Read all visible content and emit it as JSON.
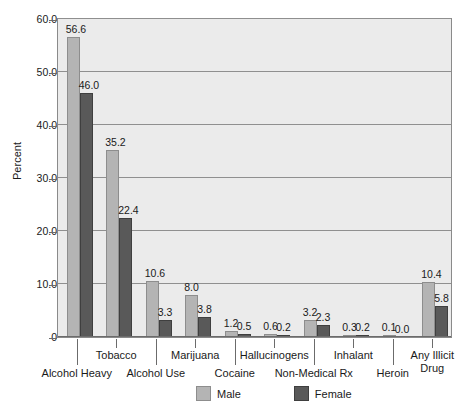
{
  "chart_data": {
    "type": "bar",
    "title": "",
    "xlabel": "",
    "ylabel": "Percent",
    "ylim": [
      0,
      60
    ],
    "grid": true,
    "legend_position": "bottom",
    "categories": [
      "Alcohol Heavy",
      "Tobacco",
      "Alcohol Use",
      "Cocaine",
      "Marijuana",
      "Hallucinogens",
      "Non-Medical Rx",
      "Inhalant",
      "Heroin",
      "Any Illicit Drug"
    ],
    "group_labels": [
      "Alcohol Heavy",
      "Tobacco",
      "Marijuana",
      "Hallucinogens",
      "Inhalant",
      "Any Illicit Drug"
    ],
    "plot_categories": [
      "Alcohol Heavy",
      "Tobacco",
      "Marijuana",
      "Cocaine",
      "Hallucinogens",
      "Non-Medical Rx",
      "Inhalant",
      "Heroin",
      "Any Illicit Drug"
    ],
    "series": [
      {
        "name": "Male",
        "color": "#b4b4b4",
        "values": [
          56.6,
          35.2,
          10.6,
          8.0,
          1.2,
          0.6,
          3.2,
          0.3,
          0.1,
          10.4
        ]
      },
      {
        "name": "Female",
        "color": "#595959",
        "values": [
          46.0,
          22.4,
          3.3,
          3.8,
          0.5,
          0.2,
          2.3,
          0.2,
          0.0,
          5.8
        ]
      }
    ],
    "groups": [
      {
        "label": "Alcohol Heavy",
        "male": 56.6,
        "female": 46.0
      },
      {
        "label": "Tobacco",
        "male": 35.2,
        "female": 22.4
      },
      {
        "label": "Alcohol Use",
        "male": 10.6,
        "female": 3.3
      },
      {
        "label": "Marijuana",
        "male": 8.0,
        "female": 3.8
      },
      {
        "label": "Cocaine",
        "male": 1.2,
        "female": 0.5
      },
      {
        "label": "Hallucinogens",
        "male": 0.6,
        "female": 0.2
      },
      {
        "label": "Non-Medical Rx",
        "male": 3.2,
        "female": 2.3
      },
      {
        "label": "Inhalant",
        "male": 0.3,
        "female": 0.2
      },
      {
        "label": "Heroin",
        "male": 0.1,
        "female": 0.0
      },
      {
        "label": "Any Illicit Drug",
        "male": 10.4,
        "female": 5.8
      }
    ],
    "yticks": [
      "0",
      "10.0",
      "20.0",
      "30.0",
      "40.0",
      "50.0",
      "60.0"
    ],
    "ytick_values": [
      0,
      10,
      20,
      30,
      40,
      50,
      60
    ],
    "value_labels": {
      "male": [
        "56.6",
        "35.2",
        "10.6",
        "8.0",
        "1.2",
        "0.6",
        "3.2",
        "0.3",
        "0.1",
        "10.4"
      ],
      "female": [
        "46.0",
        "22.4",
        "3.3",
        "3.8",
        "0.5",
        "0.2",
        "2.3",
        "0.2",
        "0.0",
        "5.8"
      ]
    }
  },
  "axes": {
    "y_title": "Percent",
    "ticks": [
      {
        "label": "60.0",
        "value": 60
      },
      {
        "label": "50.0",
        "value": 50
      },
      {
        "label": "40.0",
        "value": 40
      },
      {
        "label": "30.0",
        "value": 30
      },
      {
        "label": "20.0",
        "value": 20
      },
      {
        "label": "10.0",
        "value": 10
      },
      {
        "label": "0",
        "value": 0
      }
    ]
  },
  "x_labels": {
    "upper_row": [
      {
        "text": "Tobacco"
      },
      {
        "text": "Marijuana"
      },
      {
        "text": "Hallucinogens"
      },
      {
        "text": "Inhalant"
      },
      {
        "text": "Any Illicit"
      }
    ],
    "lower_row": [
      {
        "text": "Alcohol Heavy"
      },
      {
        "text": "Alcohol Use"
      },
      {
        "text": "Cocaine"
      },
      {
        "text": "Non-Medical Rx"
      },
      {
        "text": "Heroin"
      },
      {
        "text": "Drug"
      }
    ]
  },
  "legend": {
    "items": [
      {
        "label": "Male",
        "color": "#b4b4b4"
      },
      {
        "label": "Female",
        "color": "#595959"
      }
    ]
  },
  "colors": {
    "male": "#b4b4b4",
    "female": "#595959",
    "plot_background": "#ebebeb",
    "page_background": "#ffffff",
    "gridline": "#8f8f8f",
    "axis": "#6b6b6b",
    "text": "#1a1a1a"
  }
}
